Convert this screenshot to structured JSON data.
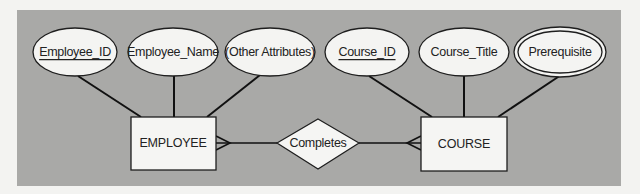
{
  "diagram": {
    "type": "entity-relationship",
    "colors": {
      "page_background": "#f3f3f1",
      "panel_background": "#a9a9a7",
      "shape_fill": "#f4f4f2",
      "stroke": "#1e1e1e"
    },
    "entities": [
      {
        "name": "EMPLOYEE",
        "attributes": [
          {
            "label": "Employee_ID",
            "key": true,
            "multivalued": false
          },
          {
            "label": "Employee_Name",
            "key": false,
            "multivalued": false
          },
          {
            "label": "(Other Attributes)",
            "key": false,
            "multivalued": false
          }
        ]
      },
      {
        "name": "COURSE",
        "attributes": [
          {
            "label": "Course_ID",
            "key": true,
            "multivalued": false
          },
          {
            "label": "Course_Title",
            "key": false,
            "multivalued": false
          },
          {
            "label": "Prerequisite",
            "key": false,
            "multivalued": true
          }
        ]
      }
    ],
    "relationship": {
      "name": "Completes",
      "from": "EMPLOYEE",
      "to": "COURSE",
      "from_cardinality": "many",
      "to_cardinality": "many"
    }
  }
}
